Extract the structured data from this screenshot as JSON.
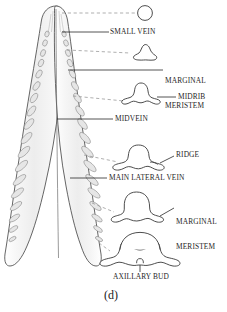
{
  "figure": {
    "caption": "(d)"
  },
  "colors": {
    "ink": "#1f1f1f",
    "outline": "#3a3a3a",
    "leaf_fill": "#f2f2f2",
    "vein_fill": "#e4e4e4",
    "leader_solid": "#2a2a2a",
    "leader_dashed": "#8c8c8c",
    "background": "#ffffff"
  },
  "labels": [
    {
      "id": "small-vein",
      "text": "SMALL VEIN",
      "lines": [
        "SMALL VEIN"
      ],
      "x": 110,
      "y": 28
    },
    {
      "id": "marginal-meristem-upper",
      "text": "MARGINAL MERISTEM",
      "lines": [
        "MARGINAL",
        "MERISTEM"
      ],
      "x": 165,
      "y": 62
    },
    {
      "id": "midrib",
      "text": "MIDRIB",
      "lines": [
        "MIDRIB"
      ],
      "x": 178,
      "y": 93
    },
    {
      "id": "midvein",
      "text": "MIDVEIN",
      "lines": [
        "MIDVEIN"
      ],
      "x": 115,
      "y": 115
    },
    {
      "id": "ridge",
      "text": "RIDGE",
      "lines": [
        "RIDGE"
      ],
      "x": 176,
      "y": 151
    },
    {
      "id": "main-lateral-vein",
      "text": "MAIN LATERAL VEIN",
      "lines": [
        "MAIN LATERAL VEIN"
      ],
      "x": 109,
      "y": 174
    },
    {
      "id": "marginal-meristem-lower",
      "text": "MARGINAL MERISTEM",
      "lines": [
        "MARGINAL",
        "MERISTEM"
      ],
      "x": 176,
      "y": 203
    },
    {
      "id": "axillary-bud",
      "text": "AXILLARY BUD",
      "lines": [
        "AXILLARY BUD"
      ],
      "x": 113,
      "y": 277
    }
  ],
  "cross_sections": [
    {
      "id": "stage-1-circle",
      "stage": 1,
      "shape": "circle",
      "section_level_y": 16
    },
    {
      "id": "stage-2-trilobed",
      "stage": 2,
      "shape": "rounded-triangle",
      "section_level_y": 53
    },
    {
      "id": "stage-3-midrib-dome",
      "stage": 3,
      "shape": "dome-with-small-wings",
      "section_level_y": 100
    },
    {
      "id": "stage-4-ridge-dome",
      "stage": 4,
      "shape": "dome-with-broad-lobes",
      "section_level_y": 160
    },
    {
      "id": "stage-5-round-dome",
      "stage": 5,
      "shape": "large-round-dome",
      "section_level_y": 211
    },
    {
      "id": "stage-6-axillary-bud",
      "stage": 6,
      "shape": "wide-bell-with-bud",
      "section_level_y": 250
    }
  ],
  "leaf": {
    "id": "leaf-primordium-surface-view",
    "description": "elongate leaf primordium with pointed apex, paired vein columns and flaring base"
  }
}
